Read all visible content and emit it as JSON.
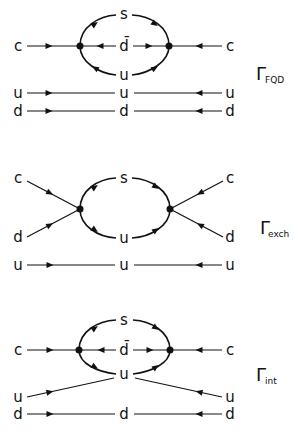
{
  "diagrams": [
    {
      "id": "fqd",
      "labels": {
        "left_top": "c",
        "right_top": "c",
        "loop_top": "s",
        "loop_mid": "d̄",
        "loop_bottom": "u",
        "spect1_left": "u",
        "spect1_mid": "u",
        "spect1_right": "u",
        "spect2_left": "d",
        "spect2_mid": "d",
        "spect2_right": "d"
      },
      "gamma": {
        "symbol": "Γ",
        "subscript": "FQD"
      }
    },
    {
      "id": "exch",
      "labels": {
        "left_top": "c",
        "left_bottom": "d",
        "right_top": "c",
        "right_bottom": "d",
        "loop_top": "s",
        "loop_bottom": "u",
        "spect_left": "u",
        "spect_mid": "u",
        "spect_right": "u"
      },
      "gamma": {
        "symbol": "Γ",
        "subscript": "exch"
      }
    },
    {
      "id": "int",
      "labels": {
        "left_top": "c",
        "right_top": "c",
        "loop_top": "s",
        "loop_mid": "d̄",
        "loop_bottom": "u",
        "u_left": "u",
        "u_right": "u",
        "spect_left": "d",
        "spect_mid": "d",
        "spect_right": "d"
      },
      "gamma": {
        "symbol": "Γ",
        "subscript": "int"
      }
    }
  ]
}
